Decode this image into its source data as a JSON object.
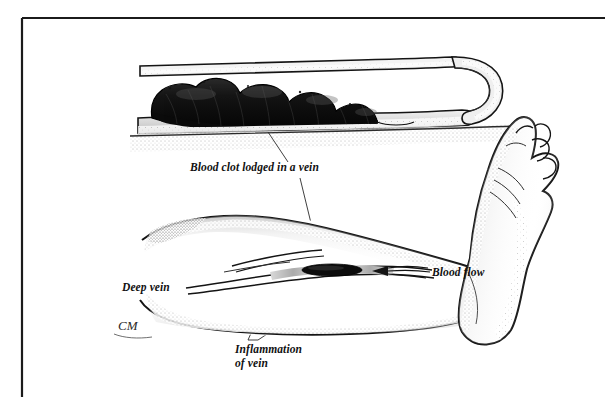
{
  "figure": {
    "background_color": "#ffffff",
    "ink_color": "#111111",
    "clot_color": "#1a1a1a",
    "inflammation_color": "#b9b9b9",
    "frame": {
      "name": "illustration-border",
      "top_rule_y": 18,
      "left_rule_x": 22,
      "stroke_width": 2.2,
      "closed_right": false,
      "closed_bottom": false
    },
    "labels": [
      {
        "id": "blood-clot",
        "text": "Blood clot lodged in a vein",
        "x": 190,
        "y": 171,
        "anchor": "start",
        "lines": [
          "Blood clot lodged in a vein"
        ]
      },
      {
        "id": "deep-vein",
        "text": "Deep vein",
        "x": 122,
        "y": 291,
        "anchor": "start",
        "lines": [
          "Deep vein"
        ]
      },
      {
        "id": "blood-flow",
        "text": "Blood flow",
        "x": 432,
        "y": 276,
        "anchor": "start",
        "lines": [
          "Blood flow"
        ]
      },
      {
        "id": "inflammation-of-vein",
        "text": "Inflammation of vein",
        "x": 235,
        "y": 353,
        "anchor": "start",
        "lines": [
          "Inflammation",
          "of vein"
        ]
      }
    ],
    "signature": {
      "id": "artist-signature",
      "text": "CM",
      "x": 118,
      "y": 330
    },
    "parts": {
      "inset_vein_name": "vein-cross-section-inset",
      "inset_clot_name": "blood-clot-mass",
      "leg_name": "leg-outline",
      "foot_name": "foot-outline",
      "deep_vein_name": "deep-vein-channel",
      "leg_clot_name": "leg-blood-clot",
      "inflammation_name": "inflamed-vein-segment",
      "flow_arrow_name": "blood-flow-arrow"
    }
  }
}
